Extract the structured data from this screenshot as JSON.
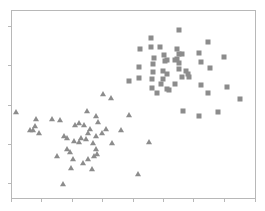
{
  "chart_data": {
    "type": "scatter",
    "title": "",
    "xlabel": "",
    "ylabel": "",
    "grid": false,
    "legend": null,
    "tick_labels_shown": false,
    "marker_color": "#8c8c8c",
    "frame": {
      "left": 11,
      "top": 10,
      "right": 255,
      "bottom": 198
    },
    "x_ticks_px": [
      11,
      41,
      72,
      102,
      133,
      163,
      193,
      224,
      255
    ],
    "y_ticks_px": [
      26,
      65,
      105,
      144,
      183
    ],
    "series": [
      {
        "name": "squares",
        "marker": "square",
        "points_px": [
          [
            179,
            30
          ],
          [
            151,
            38
          ],
          [
            208,
            42
          ],
          [
            140,
            49
          ],
          [
            151,
            47
          ],
          [
            160,
            47
          ],
          [
            177,
            49
          ],
          [
            199,
            53
          ],
          [
            179,
            54
          ],
          [
            182,
            54
          ],
          [
            164,
            55
          ],
          [
            224,
            57
          ],
          [
            154,
            58
          ],
          [
            167,
            60
          ],
          [
            165,
            61
          ],
          [
            175,
            60
          ],
          [
            177,
            59
          ],
          [
            201,
            62
          ],
          [
            179,
            63
          ],
          [
            153,
            64
          ],
          [
            139,
            67
          ],
          [
            210,
            68
          ],
          [
            179,
            69
          ],
          [
            153,
            72
          ],
          [
            163,
            71
          ],
          [
            186,
            71
          ],
          [
            188,
            74
          ],
          [
            167,
            74
          ],
          [
            182,
            77
          ],
          [
            139,
            78
          ],
          [
            189,
            77
          ],
          [
            152,
            79
          ],
          [
            163,
            79
          ],
          [
            129,
            81
          ],
          [
            161,
            84
          ],
          [
            175,
            84
          ],
          [
            201,
            85
          ],
          [
            227,
            87
          ],
          [
            152,
            88
          ],
          [
            167,
            89
          ],
          [
            169,
            90
          ],
          [
            157,
            93
          ],
          [
            208,
            93
          ],
          [
            240,
            99
          ],
          [
            183,
            111
          ],
          [
            218,
            112
          ],
          [
            199,
            116
          ]
        ]
      },
      {
        "name": "triangles",
        "marker": "triangle",
        "points_px": [
          [
            103,
            94
          ],
          [
            111,
            98
          ],
          [
            16,
            112
          ],
          [
            87,
            111
          ],
          [
            129,
            115
          ],
          [
            36,
            119
          ],
          [
            52,
            119
          ],
          [
            60,
            120
          ],
          [
            96,
            116
          ],
          [
            98,
            122
          ],
          [
            75,
            125
          ],
          [
            79,
            123
          ],
          [
            84,
            125
          ],
          [
            35,
            126
          ],
          [
            90,
            129
          ],
          [
            106,
            129
          ],
          [
            121,
            130
          ],
          [
            30,
            130
          ],
          [
            33,
            130
          ],
          [
            39,
            133
          ],
          [
            88,
            133
          ],
          [
            102,
            133
          ],
          [
            64,
            136
          ],
          [
            96,
            136
          ],
          [
            67,
            138
          ],
          [
            81,
            138
          ],
          [
            86,
            139
          ],
          [
            74,
            141
          ],
          [
            79,
            142
          ],
          [
            93,
            143
          ],
          [
            112,
            143
          ],
          [
            149,
            142
          ],
          [
            67,
            149
          ],
          [
            96,
            149
          ],
          [
            70,
            152
          ],
          [
            97,
            154
          ],
          [
            94,
            156
          ],
          [
            57,
            156
          ],
          [
            73,
            159
          ],
          [
            88,
            159
          ],
          [
            83,
            163
          ],
          [
            71,
            168
          ],
          [
            92,
            169
          ],
          [
            138,
            174
          ],
          [
            63,
            184
          ]
        ]
      }
    ]
  }
}
